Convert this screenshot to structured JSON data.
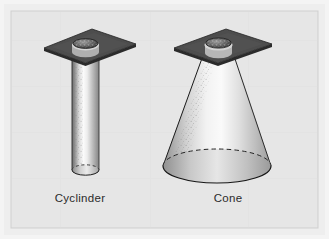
{
  "figure": {
    "background_color": "#e9e9e9",
    "frame_color": "#dcdcdc",
    "border_color": "#c6c6c6",
    "plate_color": "#4a4a4a",
    "plate_edge_color": "#2e2e2e",
    "nozzle_color": "#3a3a3a",
    "spray_light": "#f6f6f6",
    "spray_mid": "#b4b4b4",
    "spray_dark": "#5d5d5d",
    "outline_color": "#1a1a1a",
    "label_color": "#2b2b2b"
  },
  "items": [
    {
      "id": "cylinder",
      "label": "Cyclinder",
      "shape": "cylinder",
      "description": "Straight-sided cylindrical spray pattern from nozzle in mounting plate"
    },
    {
      "id": "cone",
      "label": "Cone",
      "shape": "cone",
      "description": "Widening conical spray pattern from nozzle in mounting plate"
    }
  ]
}
